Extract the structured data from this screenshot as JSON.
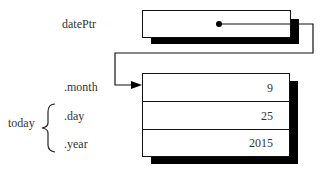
{
  "pointer": {
    "label": "datePtr"
  },
  "struct": {
    "name": "today",
    "members": [
      {
        "label": ".month",
        "value": "9"
      },
      {
        "label": ".day",
        "value": "25"
      },
      {
        "label": ".year",
        "value": "2015"
      }
    ]
  }
}
